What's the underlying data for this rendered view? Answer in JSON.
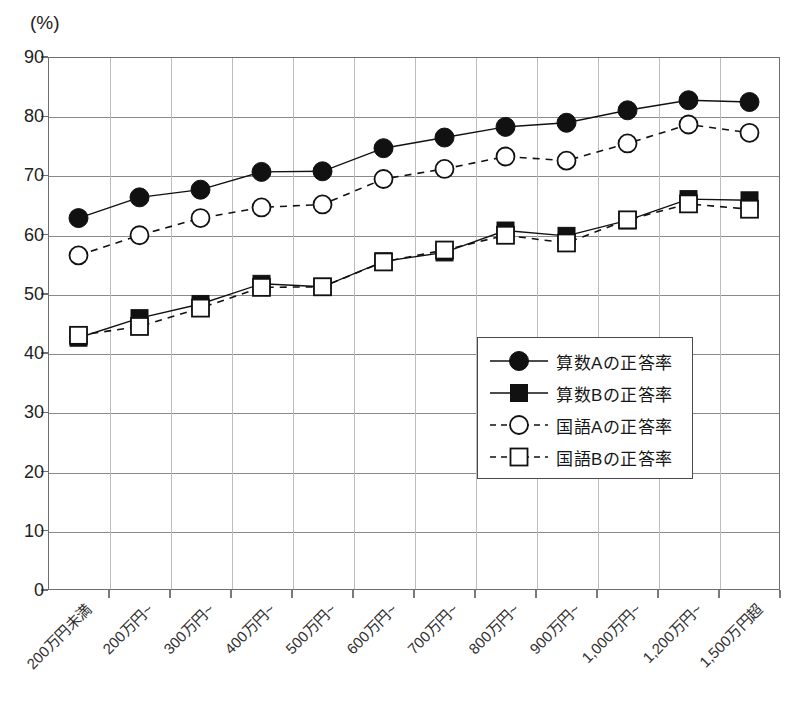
{
  "unit_label": "(%)",
  "chart_data": {
    "type": "line",
    "title": "",
    "xlabel": "",
    "ylabel": "(%)",
    "ylim": [
      0,
      90
    ],
    "ytick_step": 10,
    "yticks": [
      0,
      10,
      20,
      30,
      40,
      50,
      60,
      70,
      80,
      90
    ],
    "grid": true,
    "legend_position": "inside-center-right",
    "categories": [
      "200万円未満",
      "200万円~",
      "300万円~",
      "400万円~",
      "500万円~",
      "600万円~",
      "700万円~",
      "800万円~",
      "900万円~",
      "1,000万円~",
      "1,200万円~",
      "1,500万円超"
    ],
    "series": [
      {
        "name": "算数Aの正答率",
        "marker": "filled-circle",
        "line": "solid",
        "color": "#111111",
        "values": [
          62.8,
          66.3,
          67.6,
          70.6,
          70.7,
          74.6,
          76.4,
          78.2,
          78.9,
          81.0,
          82.7,
          82.4
        ]
      },
      {
        "name": "算数Bの正答率",
        "marker": "filled-square",
        "line": "solid",
        "color": "#111111",
        "values": [
          42.6,
          45.9,
          48.3,
          51.7,
          51.2,
          55.5,
          57.0,
          60.7,
          59.8,
          62.4,
          66.0,
          65.8
        ]
      },
      {
        "name": "国語Aの正答率",
        "marker": "open-circle",
        "line": "dashed",
        "color": "#111111",
        "values": [
          56.5,
          59.9,
          62.8,
          64.6,
          65.1,
          69.4,
          71.1,
          73.2,
          72.5,
          75.4,
          78.6,
          77.2
        ]
      },
      {
        "name": "国語Bの正答率",
        "marker": "open-square",
        "line": "dashed",
        "color": "#111111",
        "values": [
          43.0,
          44.5,
          47.6,
          51.1,
          51.2,
          55.4,
          57.4,
          59.9,
          58.6,
          62.5,
          65.2,
          64.3
        ]
      }
    ]
  },
  "legend": {
    "items": [
      {
        "label": "算数Aの正答率",
        "marker": "filled-circle",
        "line": "solid"
      },
      {
        "label": "算数Bの正答率",
        "marker": "filled-square",
        "line": "solid"
      },
      {
        "label": "国語Aの正答率",
        "marker": "open-circle",
        "line": "dashed"
      },
      {
        "label": "国語Bの正答率",
        "marker": "open-square",
        "line": "dashed"
      }
    ]
  }
}
